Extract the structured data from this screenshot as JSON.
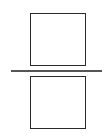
{
  "diagram": {
    "elements": [
      {
        "type": "rectangle",
        "role": "numerator-box",
        "position": "top"
      },
      {
        "type": "line",
        "role": "fraction-bar",
        "orientation": "horizontal"
      },
      {
        "type": "rectangle",
        "role": "denominator-box",
        "position": "bottom"
      }
    ],
    "colors": {
      "stroke": "#2a2a2a",
      "line": "#555555",
      "background": "#ffffff"
    }
  }
}
